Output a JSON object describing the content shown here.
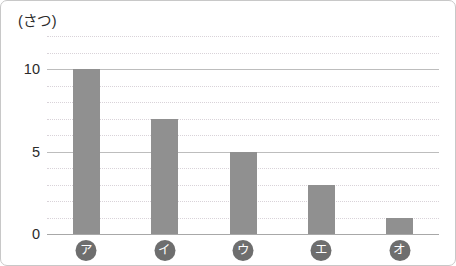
{
  "chart_data": {
    "type": "bar",
    "title": "(さつ)",
    "xlabel": "",
    "ylabel": "(さつ)",
    "categories": [
      "ア",
      "イ",
      "ウ",
      "エ",
      "オ"
    ],
    "values": [
      10,
      7,
      5,
      3,
      1
    ],
    "ylim": [
      0,
      12
    ],
    "ytick_labels": [
      "0",
      "5",
      "10"
    ],
    "ytick_values": [
      0,
      5,
      10
    ],
    "gridline_values": [
      0,
      1,
      2,
      3,
      4,
      5,
      6,
      7,
      8,
      9,
      10,
      11,
      12
    ],
    "major_gridline_values": [
      0,
      5,
      10
    ],
    "grid": true,
    "legend": "none",
    "bar_color": "#909090",
    "gridline_color": "#d9d3d9",
    "major_gridline_color": "#bdbdbd",
    "axis_color": "#a8a8a8",
    "label_badge_color": "#6e6e6e",
    "label_text_color": "#ffffff",
    "text_color": "#2b2b2b",
    "frame_color": "#c8c8c8",
    "background": "#ffffff"
  }
}
